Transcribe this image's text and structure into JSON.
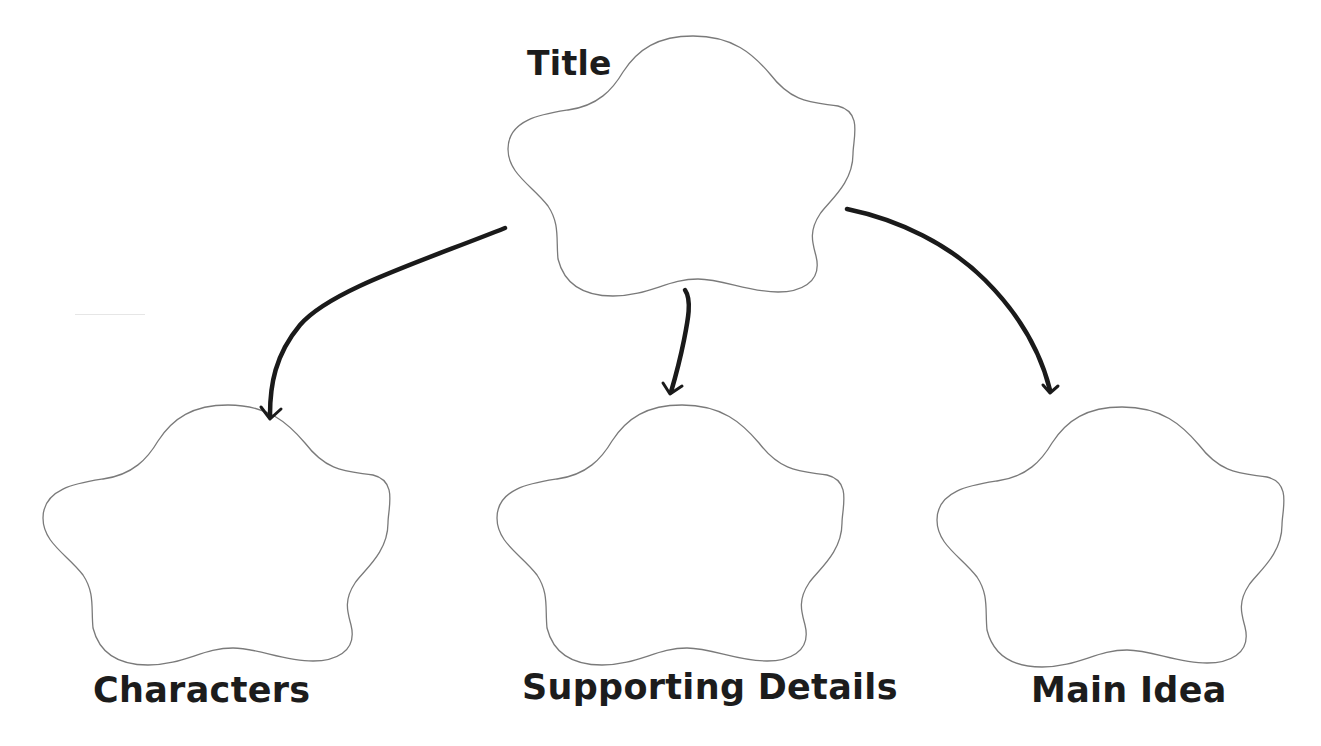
{
  "diagram": {
    "type": "graphic-organizer",
    "nodes": [
      {
        "id": "title",
        "label": "Title",
        "shape": "flower",
        "position": "top-center"
      },
      {
        "id": "characters",
        "label": "Characters",
        "shape": "flower",
        "position": "bottom-left"
      },
      {
        "id": "supporting_details",
        "label": "Supporting Details",
        "shape": "flower",
        "position": "bottom-center"
      },
      {
        "id": "main_idea",
        "label": "Main Idea",
        "shape": "flower",
        "position": "bottom-right"
      }
    ],
    "edges": [
      {
        "from": "title",
        "to": "characters",
        "style": "hand-drawn-arrow"
      },
      {
        "from": "title",
        "to": "supporting_details",
        "style": "hand-drawn-arrow"
      },
      {
        "from": "title",
        "to": "main_idea",
        "style": "hand-drawn-arrow"
      }
    ]
  },
  "labels": {
    "title": "Title",
    "characters": "Characters",
    "supporting_details": "Supporting Details",
    "main_idea": "Main Idea"
  },
  "colors": {
    "outline": "#7a7a7a",
    "arrow": "#1a1a1a",
    "text": "#1c1c1c",
    "background": "#ffffff"
  }
}
